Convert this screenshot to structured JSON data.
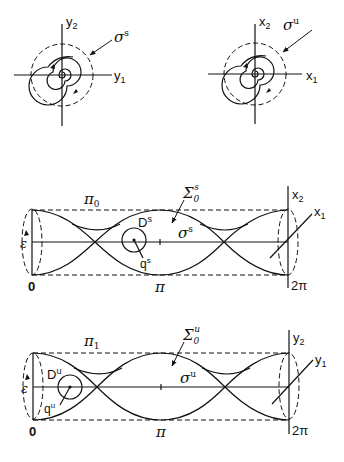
{
  "panels": {
    "stable_phase": {
      "axis_h": "y",
      "axis_h_sub": "1",
      "axis_v": "y",
      "axis_v_sub": "2",
      "curve_label": "σ",
      "curve_sup": "s"
    },
    "unstable_phase": {
      "axis_h": "x",
      "axis_h_sub": "1",
      "axis_v": "x",
      "axis_v_sub": "2",
      "curve_label": "σ",
      "curve_sup": "u"
    },
    "stable_cylinder": {
      "plane_label": "π",
      "plane_sub": "0",
      "surface_label": "Σ",
      "surface_sub": "0",
      "surface_sup": "s",
      "disk_label": "D",
      "disk_sup": "s",
      "point_label": "q",
      "point_sup": "s",
      "orbit_label": "σ",
      "orbit_sup": "s",
      "radius_label": "ε",
      "tick_start": "0",
      "tick_mid": "π",
      "tick_end": "2π",
      "axis_v": "x",
      "axis_v_sub": "2",
      "axis_d": "x",
      "axis_d_sub": "1"
    },
    "unstable_cylinder": {
      "plane_label": "π",
      "plane_sub": "1",
      "surface_label": "Σ",
      "surface_sub": "0",
      "surface_sup": "u",
      "disk_label": "D",
      "disk_sup": "u",
      "point_label": "q",
      "point_sup": "u",
      "orbit_label": "σ",
      "orbit_sup": "u",
      "radius_label": "ε",
      "tick_start": "0",
      "tick_mid": "π",
      "tick_end": "2π",
      "axis_v": "y",
      "axis_v_sub": "2",
      "axis_d": "y",
      "axis_d_sub": "1"
    }
  }
}
